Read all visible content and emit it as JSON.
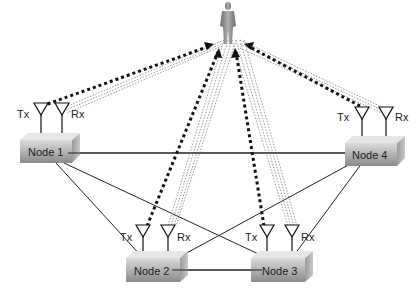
{
  "diagram": {
    "type": "wireless sensing network with human target",
    "target": {
      "name": "person",
      "icon": "person-icon"
    },
    "antenna_labels": {
      "tx": "Tx",
      "rx": "Rx"
    },
    "nodes": [
      {
        "id": "node1",
        "label": "Node 1"
      },
      {
        "id": "node2",
        "label": "Node 2"
      },
      {
        "id": "node3",
        "label": "Node 3"
      },
      {
        "id": "node4",
        "label": "Node 4"
      }
    ],
    "links": [
      [
        "Node 1",
        "Node 4"
      ],
      [
        "Node 1",
        "Node 2"
      ],
      [
        "Node 1",
        "Node 3"
      ],
      [
        "Node 2",
        "Node 3"
      ],
      [
        "Node 2",
        "Node 4"
      ],
      [
        "Node 3",
        "Node 4"
      ]
    ],
    "signal_paths": {
      "transmit_style": "heavy dotted arrow (Tx to person)",
      "reflect_style": "light dotted multipath (person to Rx)"
    },
    "colors": {
      "node_fill_top": "#d9d9d9",
      "node_fill_bottom": "#8c8c8c",
      "line": "#222222",
      "reflect": "#999999"
    }
  }
}
